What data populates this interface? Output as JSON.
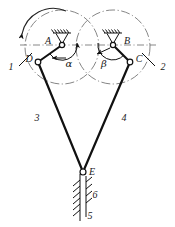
{
  "diagram": {
    "type": "kinematic-mechanism-schematic",
    "background_color": "#ffffff",
    "line_color": "#111111",
    "centerline_color": "#666666",
    "labels": {
      "pivot_a": "A",
      "pivot_b": "B",
      "joint_d": "D",
      "joint_c": "C",
      "joint_e": "E",
      "angle_alpha": "α",
      "angle_beta": "β",
      "link_1": "1",
      "link_2": "2",
      "link_3": "3",
      "link_4": "4",
      "link_5": "5",
      "link_6": "6"
    },
    "geometry": {
      "pivot_a": [
        62,
        45
      ],
      "pivot_b": [
        113,
        45
      ],
      "joint_d": [
        38,
        62
      ],
      "joint_c": [
        130,
        62
      ],
      "joint_e": [
        83,
        172
      ],
      "circle_left_center": [
        62,
        47
      ],
      "circle_left_radius": 37,
      "circle_right_center": [
        113,
        47
      ],
      "circle_right_radius": 37,
      "guide_x": 83,
      "guide_top": 176,
      "guide_bottom": 221
    },
    "annotations": {
      "rotation_direction": "counter-clockwise",
      "ground_symbol": "fixed-pivot-hatched",
      "slider_guide": "vertical-hatched-ground"
    }
  }
}
